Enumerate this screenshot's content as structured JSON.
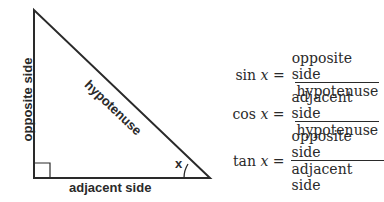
{
  "diagram": {
    "type": "right-triangle",
    "labels": {
      "opposite": "opposite side",
      "adjacent": "adjacent side",
      "hypotenuse": "hypotenuse",
      "angle": "x"
    },
    "colors": {
      "stroke": "#2a2a2a",
      "background": "#ffffff"
    }
  },
  "formulas": [
    {
      "fn": "sin",
      "var": "x",
      "eq": "=",
      "numerator": "opposite side",
      "denominator": "hypotenuse"
    },
    {
      "fn": "cos",
      "var": "x",
      "eq": "=",
      "numerator": "adjacent side",
      "denominator": "hypotenuse"
    },
    {
      "fn": "tan",
      "var": "x",
      "eq": "=",
      "numerator": "opposite side",
      "denominator": "adjacent side"
    }
  ]
}
